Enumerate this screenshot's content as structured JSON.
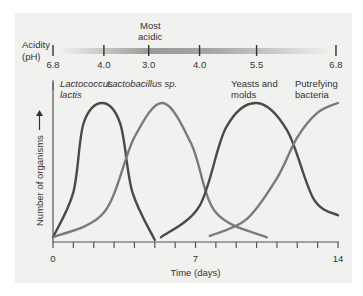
{
  "chart_data": {
    "type": "line",
    "title": "",
    "xlabel": "Time (days)",
    "ylabel": "Number of organisms",
    "xlim": [
      0,
      14
    ],
    "x_ticks": [
      0,
      7,
      14
    ],
    "x_minor_ticks_every": 1,
    "grid": false,
    "ph_scale": {
      "label_line1": "Acidity",
      "label_line2": "(pH)",
      "annotation_line1": "Most",
      "annotation_line2": "acidic",
      "ticks": [
        {
          "x": 0,
          "label": "6.8"
        },
        {
          "x": 2.5,
          "label": "4.0"
        },
        {
          "x": 4.7,
          "label": "3.0"
        },
        {
          "x": 7.2,
          "label": "4.0"
        },
        {
          "x": 10.0,
          "label": "5.5"
        },
        {
          "x": 13.9,
          "label": "6.8"
        }
      ]
    },
    "series": [
      {
        "name": "Lactococcus lactis",
        "label_line1": "Lactococcus",
        "label_line2": "lactis",
        "italic": true,
        "color": "#4a4a4a",
        "points": [
          [
            0,
            0.02
          ],
          [
            1,
            0.35
          ],
          [
            1.5,
            0.85
          ],
          [
            2.4,
            1.0
          ],
          [
            3.3,
            0.85
          ],
          [
            3.9,
            0.35
          ],
          [
            5.0,
            0.0
          ]
        ]
      },
      {
        "name": "Lactobacillus sp.",
        "label_line1": "Lactobacillus sp.",
        "label_line2": "",
        "italic": true,
        "color": "#7a7a7a",
        "points": [
          [
            0,
            0.02
          ],
          [
            2.5,
            0.2
          ],
          [
            4.0,
            0.75
          ],
          [
            5.4,
            1.0
          ],
          [
            6.8,
            0.7
          ],
          [
            8.0,
            0.2
          ],
          [
            10.5,
            0.02
          ]
        ]
      },
      {
        "name": "Yeasts and molds",
        "label_line1": "Yeasts and",
        "label_line2": "molds",
        "italic": false,
        "color": "#4a4a4a",
        "points": [
          [
            5.3,
            0.02
          ],
          [
            7.2,
            0.25
          ],
          [
            8.5,
            0.82
          ],
          [
            10.0,
            1.0
          ],
          [
            11.5,
            0.8
          ],
          [
            12.8,
            0.3
          ],
          [
            14.0,
            0.18
          ]
        ]
      },
      {
        "name": "Putrefying bacteria",
        "label_line1": "Putrefying",
        "label_line2": "bacteria",
        "italic": false,
        "color": "#7a7a7a",
        "points": [
          [
            7.7,
            0.03
          ],
          [
            9.5,
            0.15
          ],
          [
            11.0,
            0.45
          ],
          [
            12.0,
            0.75
          ],
          [
            13.0,
            0.93
          ],
          [
            14.0,
            1.0
          ]
        ]
      }
    ]
  }
}
